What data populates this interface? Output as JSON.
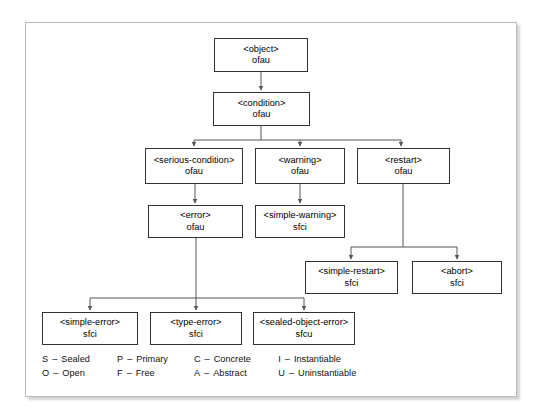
{
  "figure": {
    "frame_color": "#b9b9b9",
    "box_border_color": "#333333",
    "line_color": "#555555",
    "background": "#ffffff"
  },
  "nodes": [
    {
      "id": "object",
      "name": "<object>",
      "flags": "ofau",
      "x": 214,
      "y": 38,
      "w": 94,
      "h": 34
    },
    {
      "id": "condition",
      "name": "<condition>",
      "flags": "ofau",
      "x": 213,
      "y": 92,
      "w": 97,
      "h": 34
    },
    {
      "id": "serious-condition",
      "name": "<serious-condition>",
      "flags": "ofau",
      "x": 145,
      "y": 148,
      "w": 98,
      "h": 36
    },
    {
      "id": "warning",
      "name": "<warning>",
      "flags": "ofau",
      "x": 255,
      "y": 148,
      "w": 90,
      "h": 36
    },
    {
      "id": "restart",
      "name": "<restart>",
      "flags": "ofau",
      "x": 357,
      "y": 148,
      "w": 93,
      "h": 36
    },
    {
      "id": "error",
      "name": "<error>",
      "flags": "ofau",
      "x": 148,
      "y": 205,
      "w": 95,
      "h": 33
    },
    {
      "id": "simple-warning",
      "name": "<simple-warning>",
      "flags": "sfci",
      "x": 255,
      "y": 205,
      "w": 90,
      "h": 33
    },
    {
      "id": "simple-restart",
      "name": "<simple-restart>",
      "flags": "sfci",
      "x": 305,
      "y": 261,
      "w": 93,
      "h": 33
    },
    {
      "id": "abort",
      "name": "<abort>",
      "flags": "sfci",
      "x": 412,
      "y": 261,
      "w": 90,
      "h": 33
    },
    {
      "id": "simple-error",
      "name": "<simple-error>",
      "flags": "sfci",
      "x": 42,
      "y": 312,
      "w": 96,
      "h": 33
    },
    {
      "id": "type-error",
      "name": "<type-error>",
      "flags": "sfci",
      "x": 150,
      "y": 312,
      "w": 92,
      "h": 33
    },
    {
      "id": "sealed-object-error",
      "name": "<sealed-object-error>",
      "flags": "sfcu",
      "x": 253,
      "y": 312,
      "w": 102,
      "h": 33
    }
  ],
  "legend": {
    "rows": [
      [
        {
          "key": "S",
          "dash": "–",
          "meaning": "Sealed"
        },
        {
          "key": "P",
          "dash": "–",
          "meaning": "Primary"
        },
        {
          "key": "C",
          "dash": "–",
          "meaning": "Concrete"
        },
        {
          "key": "I",
          "dash": "–",
          "meaning": "Instantiable"
        }
      ],
      [
        {
          "key": "O",
          "dash": "–",
          "meaning": "Open"
        },
        {
          "key": "F",
          "dash": "–",
          "meaning": "Free"
        },
        {
          "key": "A",
          "dash": "–",
          "meaning": "Abstract"
        },
        {
          "key": "U",
          "dash": "–",
          "meaning": "Uninstantiable"
        }
      ]
    ]
  },
  "edges": [
    {
      "from": "object",
      "to": "condition"
    },
    {
      "from": "condition",
      "to": "serious-condition"
    },
    {
      "from": "condition",
      "to": "warning"
    },
    {
      "from": "condition",
      "to": "restart"
    },
    {
      "from": "serious-condition",
      "to": "error"
    },
    {
      "from": "warning",
      "to": "simple-warning"
    },
    {
      "from": "restart",
      "to": "simple-restart"
    },
    {
      "from": "restart",
      "to": "abort"
    },
    {
      "from": "error",
      "to": "simple-error"
    },
    {
      "from": "error",
      "to": "type-error"
    },
    {
      "from": "error",
      "to": "sealed-object-error"
    }
  ]
}
